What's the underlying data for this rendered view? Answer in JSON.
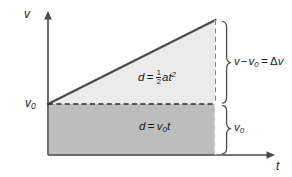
{
  "figure": {
    "axes": {
      "y_label": "v",
      "x_label": "t",
      "y_tick_label": "v",
      "y_tick_subscript": "0"
    },
    "regions": {
      "triangle": {
        "formula_lead": "d",
        "equals": "=",
        "fraction_numerator": "1",
        "fraction_denominator": "2",
        "formula_tail": "at",
        "formula_exponent": "2",
        "fill_color": "#ebebeb"
      },
      "rectangle": {
        "formula_lead": "d",
        "equals": "=",
        "formula_var": "v",
        "formula_subscript": "0",
        "formula_tail": "t",
        "fill_color": "#bdbdbd"
      }
    },
    "annotations": {
      "delta_v": {
        "part_a": "v",
        "minus": "−",
        "part_b": "v",
        "part_b_subscript": "0",
        "equals": "=",
        "delta": "Δ",
        "part_c": "v"
      },
      "v0_span": {
        "var": "v",
        "subscript": "0"
      }
    },
    "colors": {
      "background": "#ffffff",
      "axis": "#555555",
      "curve": "#3d3d3d",
      "dashed": "#2b2b2b",
      "brace": "#3d3d3d",
      "text": "#1a1a1a",
      "triangle_fill": "#ebebeb",
      "rectangle_fill": "#bdbdbd"
    }
  }
}
